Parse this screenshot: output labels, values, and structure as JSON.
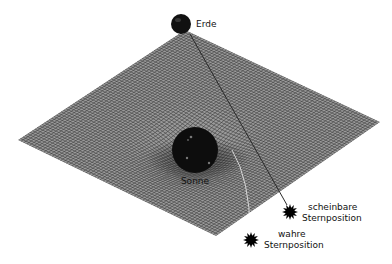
{
  "diagram": {
    "type": "spacetime-curvature-illustration",
    "colors": {
      "background": "#ffffff",
      "mesh": "#3c3c3c",
      "bodies": "#111111",
      "ray": "#2a2a2a"
    },
    "labels": {
      "earth": "Erde",
      "sun": "Sonne",
      "apparent_star_line1": "scheinbare",
      "apparent_star_line2": "Sternposition",
      "true_star_line1": "wahre",
      "true_star_line2": "Sternposition"
    },
    "icons": {
      "earth": "earth-sphere-icon",
      "sun": "sun-sphere-icon",
      "apparent_star": "star-burst-icon",
      "true_star": "star-burst-icon"
    }
  }
}
